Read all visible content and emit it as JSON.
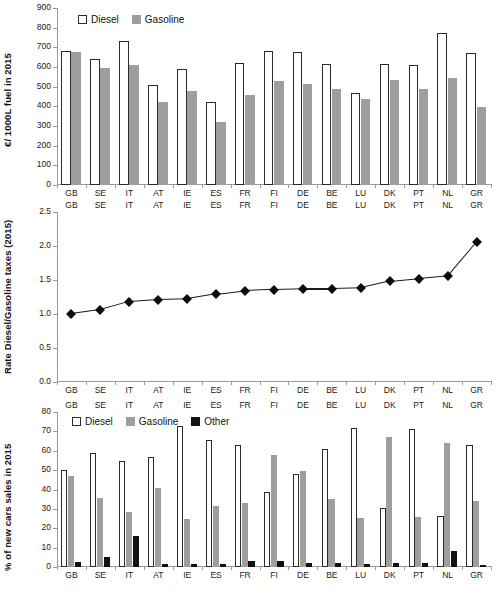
{
  "figure": {
    "width": 501,
    "height": 614,
    "background": "#ffffff",
    "colors": {
      "diesel": "#ffffff",
      "diesel_edge": "#2b2b2b",
      "gasoline": "#9e9e9e",
      "other": "#111111",
      "axis": "#9a9a9a",
      "line": "#1a1a1a",
      "marker": "#0d0d0d"
    }
  },
  "countries": [
    "GB",
    "SE",
    "IT",
    "AT",
    "IE",
    "ES",
    "FR",
    "FI",
    "DE",
    "BE",
    "LU",
    "DK",
    "PT",
    "NL",
    "GR"
  ],
  "chart_data": [
    {
      "type": "bar",
      "id": "fuel-prices",
      "title": "",
      "xlabel": "",
      "ylabel": "€/ 1000L  fuel in 2015",
      "ylim": [
        0,
        900
      ],
      "yticks": [
        0,
        100,
        200,
        300,
        400,
        500,
        600,
        700,
        800,
        900
      ],
      "grid": false,
      "legend_position": "top-left",
      "categories": [
        "GB",
        "SE",
        "IT",
        "AT",
        "IE",
        "ES",
        "FR",
        "FI",
        "DE",
        "BE",
        "LU",
        "DK",
        "PT",
        "NL",
        "GR"
      ],
      "series": [
        {
          "name": "Diesel",
          "style": "open",
          "values": [
            680,
            640,
            730,
            508,
            590,
            420,
            620,
            683,
            678,
            615,
            470,
            615,
            608,
            772,
            672
          ]
        },
        {
          "name": "Gasoline",
          "style": "filled-gray",
          "values": [
            676,
            597,
            612,
            420,
            478,
            322,
            458,
            530,
            512,
            487,
            437,
            535,
            490,
            542,
            395
          ]
        }
      ]
    },
    {
      "type": "line",
      "id": "tax-rate-ratio",
      "title": "",
      "xlabel": "",
      "ylabel": "Rate Diesel/Gasoline taxes (2015)",
      "ylim": [
        0.0,
        2.5
      ],
      "yticks": [
        "0.0",
        "0.5",
        "1.0",
        "1.5",
        "2.0",
        "2.5"
      ],
      "ytick_values": [
        0.0,
        0.5,
        1.0,
        1.5,
        2.0,
        2.5
      ],
      "grid": false,
      "marker": "diamond",
      "x": [
        "GB",
        "SE",
        "IT",
        "AT",
        "IE",
        "ES",
        "FR",
        "FI",
        "DE",
        "BE",
        "LU",
        "DK",
        "PT",
        "NL",
        "GR"
      ],
      "values": [
        1.0,
        1.06,
        1.18,
        1.21,
        1.22,
        1.29,
        1.34,
        1.36,
        1.37,
        1.37,
        1.38,
        1.48,
        1.52,
        1.56,
        2.06
      ]
    },
    {
      "type": "bar",
      "id": "new-car-sales",
      "title": "",
      "xlabel": "",
      "ylabel": "% of  new cars sales  in 2015",
      "ylim": [
        0,
        80
      ],
      "yticks": [
        0,
        10,
        20,
        30,
        40,
        50,
        60,
        70,
        80
      ],
      "grid": false,
      "legend_position": "top-left",
      "categories": [
        "GB",
        "SE",
        "IT",
        "AT",
        "IE",
        "ES",
        "FR",
        "FI",
        "DE",
        "BE",
        "LU",
        "DK",
        "PT",
        "NL",
        "GR"
      ],
      "series": [
        {
          "name": "Diesel",
          "style": "open",
          "values": [
            50.0,
            58.8,
            54.9,
            56.7,
            72.9,
            65.8,
            62.9,
            38.6,
            47.8,
            60.7,
            72.0,
            30.7,
            71.0,
            26.5,
            62.8
          ]
        },
        {
          "name": "Gasoline",
          "style": "filled-gray",
          "values": [
            47.2,
            35.6,
            28.6,
            41.0,
            25.0,
            31.5,
            33.0,
            57.7,
            49.6,
            35.3,
            25.5,
            67.0,
            25.6,
            63.8,
            34.3
          ]
        },
        {
          "name": "Other",
          "style": "filled-black",
          "values": [
            2.4,
            5.3,
            16.1,
            1.7,
            1.3,
            1.7,
            3.1,
            3.3,
            2.2,
            2.0,
            1.7,
            1.9,
            2.3,
            8.2,
            1.1
          ]
        }
      ]
    }
  ],
  "legends": {
    "fuel": [
      {
        "label": "Diesel",
        "swatch": "open"
      },
      {
        "label": "Gasoline",
        "swatch": "gray"
      }
    ],
    "sales": [
      {
        "label": "Diesel",
        "swatch": "open"
      },
      {
        "label": "Gasoline",
        "swatch": "gray"
      },
      {
        "label": "Other",
        "swatch": "black"
      }
    ]
  }
}
